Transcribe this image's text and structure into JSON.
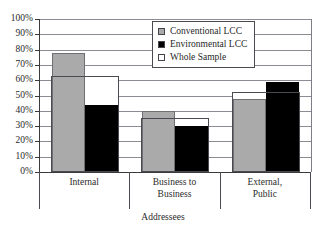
{
  "caption_remnant": "",
  "chart_data": {
    "type": "bar",
    "title": "",
    "xlabel": "Addressees",
    "ylabel": "",
    "ylim": [
      0,
      100
    ],
    "ytick_labels": [
      "100%",
      "90%",
      "80%",
      "70%",
      "60%",
      "50%",
      "40%",
      "30%",
      "20%",
      "10%",
      "0%"
    ],
    "ytick_values": [
      100,
      90,
      80,
      70,
      60,
      50,
      40,
      30,
      20,
      10,
      0
    ],
    "grid": true,
    "legend_position": "top-center",
    "categories": [
      "Internal",
      "Business to Business",
      "External, Public"
    ],
    "category_lines": [
      [
        "Internal"
      ],
      [
        "Business to",
        "Business"
      ],
      [
        "External,",
        "Public"
      ]
    ],
    "series": [
      {
        "name": "Conventional LCC",
        "color": "#aaaaaa",
        "values": [
          77.5,
          40,
          48
        ]
      },
      {
        "name": "Environmental LCC",
        "color": "#000000",
        "values": [
          43.5,
          30,
          59
        ]
      },
      {
        "name": "Whole Sample",
        "color": "#ffffff",
        "values": [
          63,
          35,
          52
        ]
      }
    ]
  },
  "legend": {
    "items": [
      {
        "label": "Conventional LCC",
        "swatch": "gray-square-swatch"
      },
      {
        "label": "Environmental LCC",
        "swatch": "black-square-swatch"
      },
      {
        "label": "Whole Sample",
        "swatch": "white-square-swatch"
      }
    ]
  }
}
